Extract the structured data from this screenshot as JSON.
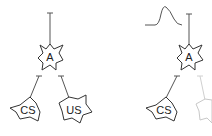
{
  "panels": [
    {
      "id": "left",
      "neurons": [
        {
          "label": "A",
          "role": "output"
        },
        {
          "label": "CS",
          "role": "conditioned-stimulus"
        },
        {
          "label": "US",
          "role": "unconditioned-stimulus"
        }
      ]
    },
    {
      "id": "right",
      "waveform": "response-pulse",
      "neurons": [
        {
          "label": "A",
          "role": "output"
        },
        {
          "label": "CS",
          "role": "conditioned-stimulus"
        },
        {
          "label": "US",
          "role": "unconditioned-stimulus",
          "state": "faded"
        }
      ]
    }
  ],
  "colors": {
    "line": "#333333",
    "faded": "#c8c8c8",
    "background": "#ffffff"
  }
}
